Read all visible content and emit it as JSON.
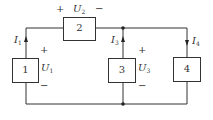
{
  "diagram": {
    "type": "circuit",
    "elements": [
      {
        "id": "1",
        "label": "1",
        "voltage": {
          "symbol": "U",
          "sub": "1",
          "plus": "+",
          "minus": "−"
        },
        "current": {
          "symbol": "I",
          "sub": "1",
          "direction": "up"
        }
      },
      {
        "id": "2",
        "label": "2",
        "voltage": {
          "symbol": "U",
          "sub": "2",
          "plus": "+",
          "minus": "−"
        }
      },
      {
        "id": "3",
        "label": "3",
        "voltage": {
          "symbol": "U",
          "sub": "3",
          "plus": "+",
          "minus": "−"
        },
        "current": {
          "symbol": "I",
          "sub": "3",
          "direction": "up"
        }
      },
      {
        "id": "4",
        "label": "4",
        "current": {
          "symbol": "I",
          "sub": "4",
          "direction": "down"
        }
      }
    ],
    "colors": {
      "line": "#333333",
      "background": "#ffffff"
    }
  }
}
